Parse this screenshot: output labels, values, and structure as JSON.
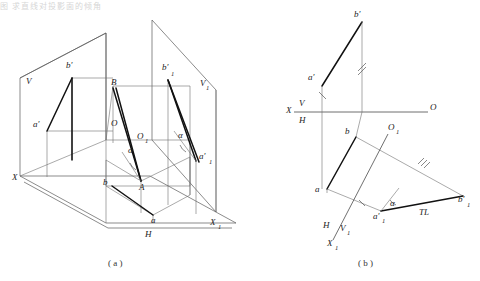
{
  "page": {
    "title_fragment": "图  求直线对投影面的倾角",
    "background": "#ffffff",
    "line_color": "#555555",
    "bold_line_color": "#111111",
    "label_color": "#222222"
  },
  "figures": [
    {
      "id": "a",
      "caption": "( a )",
      "description": "Axonometric pictorial of a line AB with its V and H projections and an auxiliary V1 plane",
      "labels": [
        {
          "key": "V",
          "text": "V",
          "x": 26,
          "y": 84
        },
        {
          "key": "bp",
          "text": "b′",
          "x": 72,
          "y": 68
        },
        {
          "key": "B",
          "text": "B",
          "x": 111,
          "y": 85
        },
        {
          "key": "bp1",
          "text": "b′",
          "x": 165,
          "y": 70
        },
        {
          "key": "bp1s",
          "text": "1",
          "x": 172,
          "y": 76
        },
        {
          "key": "V1",
          "text": "V",
          "x": 200,
          "y": 86
        },
        {
          "key": "V1s",
          "text": "1",
          "x": 206,
          "y": 90
        },
        {
          "key": "ap",
          "text": "a′",
          "x": 38,
          "y": 127
        },
        {
          "key": "O",
          "text": "O",
          "x": 114,
          "y": 126
        },
        {
          "key": "O1",
          "text": "O",
          "x": 140,
          "y": 139
        },
        {
          "key": "O1s",
          "text": "1",
          "x": 146,
          "y": 143
        },
        {
          "key": "alphaL",
          "text": "α",
          "x": 130,
          "y": 152
        },
        {
          "key": "alphaR",
          "text": "α",
          "x": 180,
          "y": 138
        },
        {
          "key": "ap1",
          "text": "a′",
          "x": 203,
          "y": 159
        },
        {
          "key": "ap1s",
          "text": "1",
          "x": 211,
          "y": 164
        },
        {
          "key": "X",
          "text": "X",
          "x": 14,
          "y": 178
        },
        {
          "key": "b",
          "text": "b",
          "x": 107,
          "y": 184
        },
        {
          "key": "A",
          "text": "A",
          "x": 141,
          "y": 188
        },
        {
          "key": "a",
          "text": "a",
          "x": 153,
          "y": 222
        },
        {
          "key": "X1",
          "text": "X",
          "x": 213,
          "y": 224
        },
        {
          "key": "X1s",
          "text": "1",
          "x": 220,
          "y": 228
        },
        {
          "key": "H",
          "text": "H",
          "x": 148,
          "y": 235
        }
      ]
    },
    {
      "id": "b",
      "caption": "( b )",
      "description": "Orthographic two-view drawing with auxiliary view giving true length TL and inclination angle alpha",
      "labels": [
        {
          "key": "bp",
          "text": "b′",
          "x": 357,
          "y": 16
        },
        {
          "key": "ap",
          "text": "a′",
          "x": 313,
          "y": 79
        },
        {
          "key": "X",
          "text": "X",
          "x": 288,
          "y": 110
        },
        {
          "key": "V",
          "text": "V",
          "x": 301,
          "y": 103
        },
        {
          "key": "H",
          "text": "H",
          "x": 301,
          "y": 120
        },
        {
          "key": "O",
          "text": "O",
          "x": 432,
          "y": 108
        },
        {
          "key": "b",
          "text": "b",
          "x": 347,
          "y": 133
        },
        {
          "key": "O1",
          "text": "O",
          "x": 391,
          "y": 129
        },
        {
          "key": "O1s",
          "text": "1",
          "x": 397,
          "y": 133
        },
        {
          "key": "a",
          "text": "a",
          "x": 318,
          "y": 190
        },
        {
          "key": "alpha",
          "text": "α",
          "x": 392,
          "y": 204
        },
        {
          "key": "TL",
          "text": "TL",
          "x": 425,
          "y": 213
        },
        {
          "key": "bp1",
          "text": "b′",
          "x": 462,
          "y": 201
        },
        {
          "key": "bp1s",
          "text": "1",
          "x": 470,
          "y": 206
        },
        {
          "key": "ap1",
          "text": "a′",
          "x": 377,
          "y": 217
        },
        {
          "key": "ap1s",
          "text": "1",
          "x": 385,
          "y": 222
        },
        {
          "key": "H2",
          "text": "H",
          "x": 326,
          "y": 226
        },
        {
          "key": "V1",
          "text": "V",
          "x": 342,
          "y": 228
        },
        {
          "key": "V1s",
          "text": "1",
          "x": 348,
          "y": 232
        },
        {
          "key": "X1",
          "text": "X",
          "x": 330,
          "y": 243
        },
        {
          "key": "X1s",
          "text": "1",
          "x": 337,
          "y": 247
        }
      ]
    }
  ],
  "annotations": {
    "true_length_label": "TL",
    "angle_symbol": "α",
    "tick_marks": "equal-length tick hatches on corresponding projection lines"
  }
}
